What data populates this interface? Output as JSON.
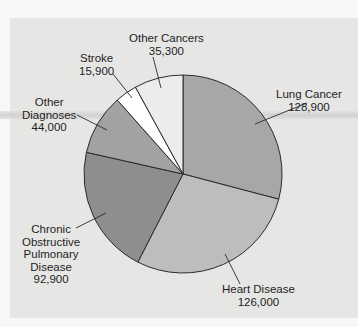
{
  "chart_data": {
    "type": "pie",
    "title": "",
    "start_angle": "12 o'clock",
    "direction": "clockwise",
    "total": 443000,
    "slices": [
      {
        "label": "Lung Cancer",
        "value": 128900,
        "color": "#a7a7a6"
      },
      {
        "label": "Heart Disease",
        "value": 126000,
        "color": "#bdbdbc"
      },
      {
        "label": "Chronic Obstructive Pulmonary Disease",
        "value": 92900,
        "color": "#8e8e8d"
      },
      {
        "label": "Other Diagnoses",
        "value": 44000,
        "color": "#a2a2a1"
      },
      {
        "label": "Stroke",
        "value": 15900,
        "color": "#ffffff"
      },
      {
        "label": "Other Cancers",
        "value": 35300,
        "color": "#ececeb"
      }
    ],
    "legend": "none (direct labels with leader lines)"
  },
  "labels": {
    "lung": {
      "name": "Lung Cancer",
      "value": "128,900"
    },
    "heart": {
      "name": "Heart Disease",
      "value": "126,000"
    },
    "copd": {
      "line1": "Chronic",
      "line2": "Obstructive",
      "line3": "Pulmonary",
      "line4": "Disease",
      "value": "92,900"
    },
    "other_diag": {
      "line1": "Other",
      "line2": "Diagnoses",
      "value": "44,000"
    },
    "stroke": {
      "name": "Stroke",
      "value": "15,900"
    },
    "other_cancers": {
      "name": "Other Cancers",
      "value": "35,300"
    }
  }
}
